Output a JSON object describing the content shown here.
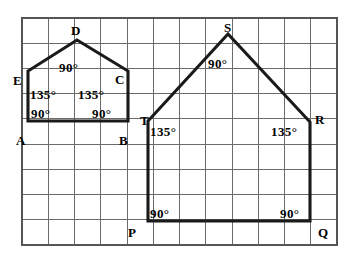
{
  "figure": {
    "background_color": "#ffffff",
    "outline_color": "#1a1a1a",
    "grid_line_color": "#6b6b6b",
    "grid_border_color": "#555555"
  },
  "grid": {
    "x0": 22,
    "y0": 18,
    "cell_w": 26.25,
    "cell_h": 25.2,
    "cols": 12,
    "rows": 9
  },
  "shapes": [
    {
      "name": "small-house",
      "vertex_order": "A B C D E",
      "points": "28,121 128,121 128,71 77,40 28,71"
    },
    {
      "name": "large-house",
      "vertex_order": "P Q R S T",
      "points": "148,221 310,221 310,122 228,34 148,121"
    }
  ],
  "vertices": [
    {
      "id": "A",
      "label": "A",
      "x": 16,
      "y": 145
    },
    {
      "id": "B",
      "label": "B",
      "x": 119,
      "y": 145
    },
    {
      "id": "C",
      "label": "C",
      "x": 115,
      "y": 84
    },
    {
      "id": "D",
      "label": "D",
      "x": 71,
      "y": 35
    },
    {
      "id": "E",
      "label": "E",
      "x": 13,
      "y": 85
    },
    {
      "id": "P",
      "label": "P",
      "x": 128,
      "y": 237
    },
    {
      "id": "Q",
      "label": "Q",
      "x": 318,
      "y": 237
    },
    {
      "id": "R",
      "label": "R",
      "x": 315,
      "y": 124
    },
    {
      "id": "S",
      "label": "S",
      "x": 224,
      "y": 32
    },
    {
      "id": "T",
      "label": "T",
      "x": 140,
      "y": 125
    }
  ],
  "angles": [
    {
      "id": "angle-D",
      "at_vertex": "D",
      "label": "90°",
      "x": 59,
      "y": 72,
      "anchor": "start"
    },
    {
      "id": "angle-E",
      "at_vertex": "E",
      "label": "135°",
      "x": 30,
      "y": 99,
      "anchor": "start"
    },
    {
      "id": "angle-C",
      "at_vertex": "C",
      "label": "135°",
      "x": 78,
      "y": 99,
      "anchor": "start"
    },
    {
      "id": "angle-A",
      "at_vertex": "A",
      "label": "90°",
      "x": 31,
      "y": 118,
      "anchor": "start"
    },
    {
      "id": "angle-B",
      "at_vertex": "B",
      "label": "90°",
      "x": 92,
      "y": 118,
      "anchor": "start"
    },
    {
      "id": "angle-S",
      "at_vertex": "S",
      "label": "90°",
      "x": 208,
      "y": 68,
      "anchor": "start"
    },
    {
      "id": "angle-T",
      "at_vertex": "T",
      "label": "135°",
      "x": 150,
      "y": 136,
      "anchor": "start"
    },
    {
      "id": "angle-R",
      "at_vertex": "R",
      "label": "135°",
      "x": 271,
      "y": 136,
      "anchor": "start"
    },
    {
      "id": "angle-P",
      "at_vertex": "P",
      "label": "90°",
      "x": 150,
      "y": 218,
      "anchor": "start"
    },
    {
      "id": "angle-Q",
      "at_vertex": "Q",
      "label": "90°",
      "x": 280,
      "y": 218,
      "anchor": "start"
    }
  ]
}
